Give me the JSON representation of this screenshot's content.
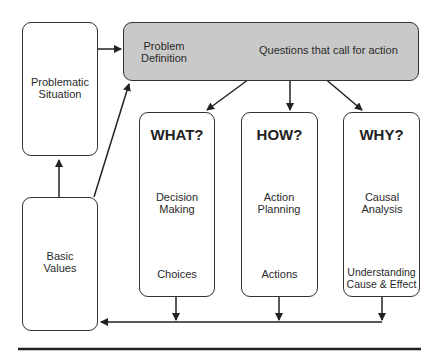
{
  "diagram": {
    "nodes": {
      "problematic_situation": "Problematic Situation",
      "basic_values": "Basic Values",
      "problem_definition": "Problem Definition",
      "questions": "Questions that call for action",
      "what": {
        "title": "WHAT?",
        "step1": "Decision Making",
        "step2": "Choices"
      },
      "how": {
        "title": "HOW?",
        "step1": "Action Planning",
        "step2": "Actions"
      },
      "why": {
        "title": "WHY?",
        "step1": "Causal Analysis",
        "step2": "Understanding Cause & Effect"
      }
    },
    "colors": {
      "header_fill": "#c9c9c9",
      "stroke": "#333333"
    }
  }
}
